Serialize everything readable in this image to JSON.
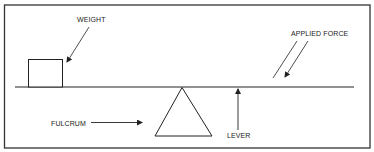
{
  "diagram": {
    "labels": {
      "weight": "WEIGHT",
      "applied_force": "APPLIED FORCE",
      "fulcrum": "FULCRUM",
      "lever": "LEVER"
    },
    "colors": {
      "stroke": "#222222",
      "frame": "#333333",
      "background": "#ffffff"
    }
  }
}
